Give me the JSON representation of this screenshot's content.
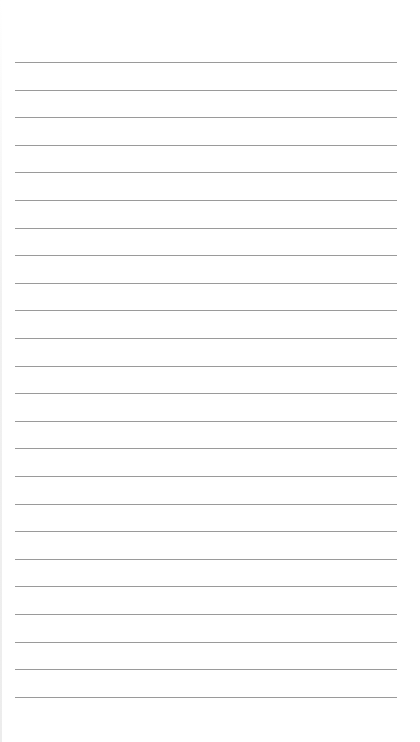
{
  "page": {
    "type": "lined-paper",
    "background_color": "#ffffff",
    "rule_color": "#9a9a9a",
    "line_count": 24,
    "first_line_y": 62,
    "line_spacing": 27.6,
    "line_left": 15,
    "line_width": 382
  }
}
